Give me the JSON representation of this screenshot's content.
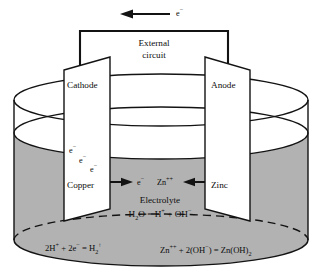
{
  "figure": {
    "type": "electrochemical-cell-schematic"
  },
  "colors": {
    "electrolyte_gray": "#b2b2b2",
    "electrolyte_gray_dark": "#a8a8a8",
    "line": "#131313",
    "plate_fill": "#ffffff",
    "background": "#ffffff",
    "text": "#0d0d0d"
  },
  "top_arrow": {
    "label_base": "e",
    "label_sup": "−",
    "direction": "left",
    "meaning": "electron-flow-direction"
  },
  "external_circuit": {
    "line1": "External",
    "line2": "circuit"
  },
  "electrodes": {
    "left": {
      "role_label": "Cathode",
      "material_label": "Copper"
    },
    "right": {
      "role_label": "Anode",
      "material_label": "Zinc"
    }
  },
  "electron_cloud": {
    "items": [
      {
        "base": "e",
        "sup": "−"
      },
      {
        "base": "e",
        "sup": "−"
      },
      {
        "base": "e",
        "sup": "−"
      }
    ]
  },
  "mid_species": {
    "electron": {
      "base": "e",
      "sup": "−"
    },
    "zinc_ion": {
      "base": "Zn",
      "sup": "++"
    },
    "left_arrow_direction": "right",
    "right_arrow_direction": "left"
  },
  "electrolyte": {
    "title": "Electrolyte",
    "equation": {
      "h2o_base": "H",
      "h2o_sub": "2",
      "h2o_tail": "O = H",
      "h_sup": "+",
      "plus": " + OH",
      "oh_sup": "−"
    }
  },
  "reactions": {
    "cathodic": {
      "p1": "2H",
      "s1": "+",
      "p2": " + 2e",
      "s2": "−",
      "p3": " = H",
      "s3": "2",
      "s4": "↑"
    },
    "anodic": {
      "p1": "Zn",
      "s1": "++",
      "p2": " + 2(OH",
      "s2": "−",
      "p3": ") = Zn(OH)",
      "s3": "2"
    }
  },
  "vessel": {
    "name": "beaker-cylinder",
    "liquid_level_label": "electrolyte-surface"
  }
}
